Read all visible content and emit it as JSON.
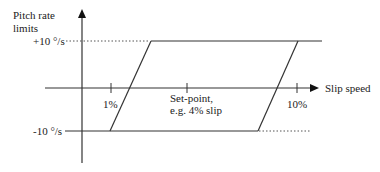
{
  "diagram": {
    "y_axis_label_line1": "Pitch rate",
    "y_axis_label_line2": "limits",
    "x_axis_label": "Slip speed",
    "upper_limit_label": "+10 °/s",
    "lower_limit_label": "-10 °/s",
    "tick_labels": {
      "low": "1%",
      "setpoint_line1": "Set-point,",
      "setpoint_line2": "e.g. 4% slip",
      "high": "10%"
    },
    "colors": {
      "line": "#333333",
      "dotted": "#555555",
      "text": "#222222",
      "background": "#ffffff"
    }
  }
}
